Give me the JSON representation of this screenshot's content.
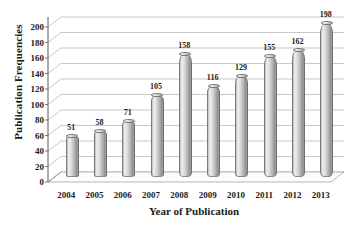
{
  "chart_data": {
    "type": "bar",
    "title": "",
    "xlabel": "Year of Publication",
    "ylabel": "Publication Frequencies",
    "categories": [
      "2004",
      "2005",
      "2006",
      "2007",
      "2008",
      "2009",
      "2010",
      "2011",
      "2012",
      "2013"
    ],
    "values": [
      51,
      58,
      71,
      105,
      158,
      116,
      129,
      155,
      162,
      198
    ],
    "ylim": [
      0,
      200
    ],
    "ytick_step": 20,
    "yticks": [
      "0",
      "20",
      "40",
      "60",
      "80",
      "100",
      "120",
      "140",
      "160",
      "180",
      "200"
    ],
    "grid": true,
    "legend": false,
    "style_3d": true,
    "bar_shape": "cylinder",
    "data_labels_shown": true,
    "colors": {
      "bar_light": "#efefef",
      "bar_mid": "#c8c8c8",
      "bar_dark": "#8e8e8e",
      "gridline": "#b0b0b0",
      "axis": "#5a5a5a",
      "text": "#1a1a1a",
      "background": "#ffffff",
      "floor": "#fbfbfb"
    }
  }
}
